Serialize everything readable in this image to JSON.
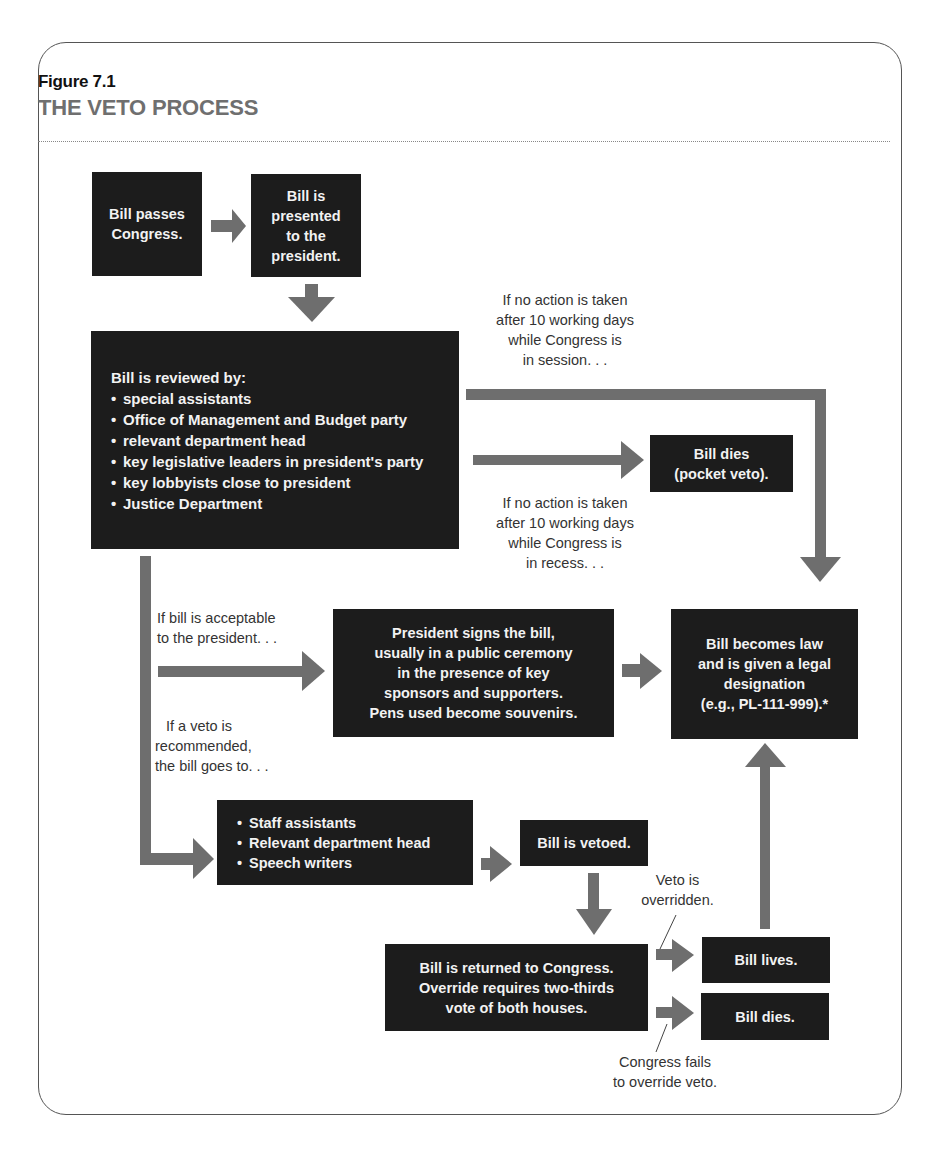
{
  "figure": {
    "label": "Figure 7.1",
    "title": "THE VETO PROCESS"
  },
  "colors": {
    "box_fill": "#1c1c1c",
    "box_text": "#f2f2f2",
    "arrow": "#6e6e6e",
    "title_gray": "#6f6f6f",
    "note_text": "#333333"
  },
  "nodes": {
    "passes": {
      "lines": [
        "Bill passes",
        "Congress."
      ]
    },
    "presented": {
      "lines": [
        "Bill is",
        "presented",
        "to the",
        "president."
      ]
    },
    "reviewed": {
      "heading": "Bill is reviewed by:",
      "items": [
        "special assistants",
        "Office of Management and Budget party",
        "relevant department head",
        "key legislative leaders in president's party",
        "key lobbyists close to president",
        "Justice Department"
      ]
    },
    "pocket_veto": {
      "lines": [
        "Bill dies",
        "(pocket veto)."
      ]
    },
    "becomes_law": {
      "lines": [
        "Bill becomes law",
        "and is given a legal",
        "designation",
        "(e.g., PL-111-999).*"
      ]
    },
    "signs": {
      "lines": [
        "President signs the bill,",
        "usually in a public ceremony",
        "in the presence of key",
        "sponsors and supporters.",
        "Pens used become souvenirs."
      ]
    },
    "veto_staff": {
      "items": [
        "Staff assistants",
        "Relevant department head",
        "Speech writers"
      ]
    },
    "vetoed": {
      "lines": [
        "Bill is vetoed."
      ]
    },
    "returned": {
      "lines": [
        "Bill is returned to Congress.",
        "Override requires two-thirds",
        "vote of both houses."
      ]
    },
    "lives": {
      "lines": [
        "Bill lives."
      ]
    },
    "dies": {
      "lines": [
        "Bill dies."
      ]
    }
  },
  "notes": {
    "in_session": [
      "If no action is taken",
      "after 10 working days",
      "while Congress is",
      "in session. . ."
    ],
    "in_recess": [
      "If no action is taken",
      "after 10 working days",
      "while Congress is",
      "in recess. . ."
    ],
    "acceptable": [
      "If bill is acceptable",
      "to the president. . ."
    ],
    "veto_recommended": [
      "If a veto is",
      "recommended,",
      "the bill goes to. . ."
    ],
    "overridden": [
      "Veto is",
      "overridden."
    ],
    "fails": [
      "Congress fails",
      "to override veto."
    ]
  },
  "edges": [
    {
      "from": "passes",
      "to": "presented"
    },
    {
      "from": "presented",
      "to": "reviewed"
    },
    {
      "from": "reviewed",
      "to": "becomes_law",
      "label": "in_session"
    },
    {
      "from": "reviewed",
      "to": "pocket_veto",
      "label": "in_recess"
    },
    {
      "from": "reviewed",
      "to": "signs",
      "label": "acceptable"
    },
    {
      "from": "reviewed",
      "to": "veto_staff",
      "label": "veto_recommended"
    },
    {
      "from": "signs",
      "to": "becomes_law"
    },
    {
      "from": "veto_staff",
      "to": "vetoed"
    },
    {
      "from": "vetoed",
      "to": "returned"
    },
    {
      "from": "returned",
      "to": "lives",
      "label": "overridden"
    },
    {
      "from": "returned",
      "to": "dies",
      "label": "fails"
    },
    {
      "from": "lives",
      "to": "becomes_law"
    }
  ]
}
